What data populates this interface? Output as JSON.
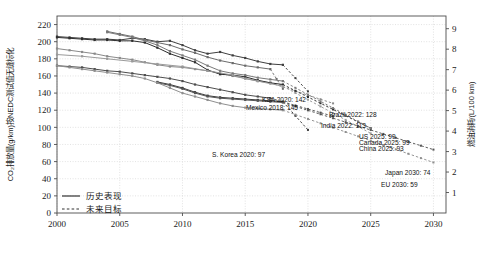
{
  "chart_data": {
    "type": "line",
    "title": "",
    "xlabel": "",
    "ylabel": "CO₂排放量(g/km)按NEDC测试值无缝标化",
    "y2label": "燃油消耗/(L/100 km)",
    "xlim": [
      2000,
      2031
    ],
    "ylim": [
      0,
      230
    ],
    "y2lim": [
      0,
      9.62
    ],
    "xticks": [
      "2000",
      "2005",
      "2010",
      "2015",
      "2020",
      "2025",
      "2030"
    ],
    "xtick_values": [
      2000,
      2005,
      2010,
      2015,
      2020,
      2025,
      2030
    ],
    "yticks": [
      "0",
      "20",
      "40",
      "60",
      "80",
      "100",
      "120",
      "140",
      "160",
      "180",
      "200",
      "220"
    ],
    "ytick_values": [
      0,
      20,
      40,
      60,
      80,
      100,
      120,
      140,
      160,
      180,
      200,
      220
    ],
    "y2ticks": [
      "1",
      "2",
      "3",
      "4",
      "5",
      "6",
      "7",
      "8",
      "9"
    ],
    "y2tick_values": [
      1,
      2,
      3,
      4,
      5,
      6,
      7,
      8,
      9
    ],
    "grid": true,
    "legend_position": "lower-left",
    "legend": [
      {
        "label": "历史表现",
        "style": "solid"
      },
      {
        "label": "未来目标",
        "style": "dashed"
      }
    ],
    "series": [
      {
        "name": "KSA",
        "color": "#3f3f3f",
        "historical": [
          [
            2000,
            206
          ],
          [
            2001,
            205
          ],
          [
            2002,
            204
          ],
          [
            2003,
            203
          ],
          [
            2004,
            203
          ],
          [
            2005,
            202
          ],
          [
            2006,
            204
          ],
          [
            2007,
            203
          ],
          [
            2008,
            200
          ],
          [
            2009,
            201
          ],
          [
            2010,
            196
          ],
          [
            2011,
            190
          ],
          [
            2012,
            186
          ],
          [
            2013,
            188
          ],
          [
            2014,
            184
          ],
          [
            2015,
            181
          ],
          [
            2016,
            177
          ],
          [
            2017,
            174
          ],
          [
            2018,
            173
          ]
        ],
        "target": [
          [
            2018,
            173
          ],
          [
            2020,
            142
          ]
        ],
        "annotation": {
          "text": "KSA 2020: 142",
          "year": 2020,
          "value": 142
        }
      },
      {
        "name": "Mexico",
        "color": "#6b6b6b",
        "historical": [
          [
            2004,
            212
          ],
          [
            2005,
            209
          ],
          [
            2006,
            206
          ],
          [
            2007,
            202
          ],
          [
            2008,
            199
          ],
          [
            2009,
            196
          ],
          [
            2010,
            191
          ],
          [
            2011,
            187
          ],
          [
            2012,
            182
          ],
          [
            2013,
            178
          ],
          [
            2014,
            175
          ],
          [
            2015,
            172
          ],
          [
            2016,
            170
          ],
          [
            2017,
            168
          ]
        ],
        "target": [
          [
            2017,
            168
          ],
          [
            2018,
            145
          ]
        ],
        "annotation": {
          "text": "Mexico 2018: 145",
          "year": 2018,
          "value": 145
        }
      },
      {
        "name": "Brazil",
        "color": "#8a8a8a",
        "historical": [
          [
            2000,
            192
          ],
          [
            2001,
            190
          ],
          [
            2002,
            188
          ],
          [
            2003,
            186
          ],
          [
            2004,
            183
          ],
          [
            2005,
            181
          ],
          [
            2006,
            179
          ],
          [
            2007,
            176
          ],
          [
            2008,
            173
          ],
          [
            2009,
            171
          ],
          [
            2010,
            170
          ],
          [
            2011,
            168
          ],
          [
            2012,
            166
          ],
          [
            2013,
            163
          ],
          [
            2014,
            160
          ],
          [
            2015,
            157
          ],
          [
            2016,
            154
          ],
          [
            2017,
            152
          ]
        ],
        "target": [
          [
            2017,
            152
          ],
          [
            2022,
            128
          ]
        ],
        "annotation": {
          "text": "Brazil 2022: 128",
          "year": 2022,
          "value": 128
        }
      },
      {
        "name": "India",
        "color": "#4d4d4d",
        "historical": [
          [
            2000,
            172
          ],
          [
            2001,
            171
          ],
          [
            2002,
            170
          ],
          [
            2003,
            168
          ],
          [
            2004,
            166
          ],
          [
            2005,
            165
          ],
          [
            2006,
            163
          ],
          [
            2007,
            161
          ],
          [
            2008,
            159
          ],
          [
            2009,
            157
          ],
          [
            2010,
            154
          ],
          [
            2011,
            150
          ],
          [
            2012,
            147
          ],
          [
            2013,
            144
          ],
          [
            2014,
            141
          ],
          [
            2015,
            138
          ],
          [
            2016,
            136
          ],
          [
            2017,
            134
          ]
        ],
        "target": [
          [
            2017,
            134
          ],
          [
            2022,
            113
          ]
        ],
        "annotation": {
          "text": "India 2022: 113",
          "year": 2022,
          "value": 113
        }
      },
      {
        "name": "US",
        "color": "#2e2e2e",
        "historical": [
          [
            2000,
            205
          ],
          [
            2001,
            204
          ],
          [
            2002,
            203
          ],
          [
            2003,
            202
          ],
          [
            2004,
            202
          ],
          [
            2005,
            201
          ],
          [
            2006,
            201
          ],
          [
            2007,
            199
          ],
          [
            2008,
            193
          ],
          [
            2009,
            186
          ],
          [
            2010,
            181
          ],
          [
            2011,
            176
          ],
          [
            2012,
            167
          ],
          [
            2013,
            162
          ],
          [
            2014,
            161
          ],
          [
            2015,
            159
          ],
          [
            2016,
            155
          ],
          [
            2017,
            152
          ],
          [
            2018,
            150
          ]
        ],
        "target": [
          [
            2018,
            150
          ],
          [
            2025,
            99
          ]
        ],
        "annotation": {
          "text": "US 2025: 99",
          "year": 2025,
          "value": 99
        }
      },
      {
        "name": "Canada",
        "color": "#7a7a7a",
        "historical": [
          [
            2004,
            211
          ],
          [
            2005,
            208
          ],
          [
            2006,
            205
          ],
          [
            2007,
            201
          ],
          [
            2008,
            196
          ],
          [
            2009,
            189
          ],
          [
            2010,
            184
          ],
          [
            2011,
            179
          ],
          [
            2012,
            172
          ],
          [
            2013,
            166
          ],
          [
            2014,
            163
          ],
          [
            2015,
            161
          ],
          [
            2016,
            158
          ],
          [
            2017,
            156
          ],
          [
            2018,
            154
          ]
        ],
        "target": [
          [
            2018,
            154
          ],
          [
            2025,
            99
          ]
        ],
        "annotation": {
          "text": "Canada 2025: 99",
          "year": 2025,
          "value": 99
        }
      },
      {
        "name": "China",
        "color": "#9a9a9a",
        "historical": [
          [
            2000,
            185
          ],
          [
            2002,
            183
          ],
          [
            2004,
            180
          ],
          [
            2006,
            177
          ],
          [
            2008,
            174
          ],
          [
            2010,
            171
          ],
          [
            2012,
            166
          ],
          [
            2014,
            161
          ],
          [
            2015,
            157
          ],
          [
            2016,
            154
          ],
          [
            2017,
            151
          ],
          [
            2018,
            148
          ]
        ],
        "target": [
          [
            2018,
            148
          ],
          [
            2025,
            93
          ]
        ],
        "annotation": {
          "text": "China 2025: 93",
          "year": 2025,
          "value": 93
        }
      },
      {
        "name": "S. Korea",
        "color": "#3a3a3a",
        "historical": [
          [
            2008,
            153
          ],
          [
            2009,
            150
          ],
          [
            2010,
            146
          ],
          [
            2011,
            141
          ],
          [
            2012,
            137
          ],
          [
            2013,
            135
          ],
          [
            2014,
            134
          ],
          [
            2015,
            133
          ],
          [
            2016,
            132
          ],
          [
            2017,
            131
          ],
          [
            2018,
            130
          ]
        ],
        "target": [
          [
            2018,
            130
          ],
          [
            2020,
            97
          ]
        ],
        "annotation": {
          "text": "S. Korea 2020: 97",
          "year": 2020,
          "value": 97
        }
      },
      {
        "name": "Japan",
        "color": "#555555",
        "historical": [
          [
            2008,
            152
          ],
          [
            2009,
            149
          ],
          [
            2010,
            145
          ],
          [
            2011,
            140
          ],
          [
            2012,
            136
          ],
          [
            2013,
            134
          ],
          [
            2014,
            133
          ],
          [
            2015,
            132
          ],
          [
            2016,
            131
          ],
          [
            2017,
            130
          ],
          [
            2018,
            129
          ]
        ],
        "target": [
          [
            2018,
            129
          ],
          [
            2030,
            74
          ]
        ],
        "annotation": {
          "text": "Japan 2030: 74",
          "year": 2030,
          "value": 74
        }
      },
      {
        "name": "EU",
        "color": "#8f8f8f",
        "historical": [
          [
            2000,
            172
          ],
          [
            2001,
            170
          ],
          [
            2002,
            168
          ],
          [
            2003,
            166
          ],
          [
            2004,
            164
          ],
          [
            2005,
            162
          ],
          [
            2006,
            160
          ],
          [
            2007,
            157
          ],
          [
            2008,
            152
          ],
          [
            2009,
            146
          ],
          [
            2010,
            140
          ],
          [
            2011,
            136
          ],
          [
            2012,
            132
          ],
          [
            2013,
            128
          ],
          [
            2014,
            125
          ],
          [
            2015,
            123
          ],
          [
            2016,
            122
          ],
          [
            2017,
            121
          ],
          [
            2018,
            120
          ]
        ],
        "target": [
          [
            2018,
            120
          ],
          [
            2030,
            59
          ]
        ],
        "annotation": {
          "text": "EU 2030: 59",
          "year": 2030,
          "value": 59
        }
      }
    ],
    "annotations": [
      {
        "text": "KSA 2020: 142",
        "x": 306,
        "y": 102,
        "anchor": "end"
      },
      {
        "text": "Mexico 2018: 145",
        "x": 298,
        "y": 110,
        "anchor": "end"
      },
      {
        "text": "Brazil 2022: 128",
        "x": 329,
        "y": 117,
        "anchor": "start"
      },
      {
        "text": "India 2022: 113",
        "x": 321,
        "y": 128,
        "anchor": "start"
      },
      {
        "text": "US 2025: 99",
        "x": 359,
        "y": 139,
        "anchor": "start"
      },
      {
        "text": "Canada 2025: 99",
        "x": 359,
        "y": 145,
        "anchor": "start"
      },
      {
        "text": "China 2025: 93",
        "x": 359,
        "y": 151,
        "anchor": "start"
      },
      {
        "text": "S. Korea 2020: 97",
        "x": 212,
        "y": 157,
        "anchor": "start"
      },
      {
        "text": "Japan 2030: 74",
        "x": 385,
        "y": 175,
        "anchor": "start"
      },
      {
        "text": "EU 2030: 59",
        "x": 381,
        "y": 187,
        "anchor": "start"
      }
    ]
  },
  "colors": {
    "axis": "#4d4d4d",
    "grid": "#cfcfcf",
    "text": "#1a1a1a",
    "background": "#ffffff"
  }
}
